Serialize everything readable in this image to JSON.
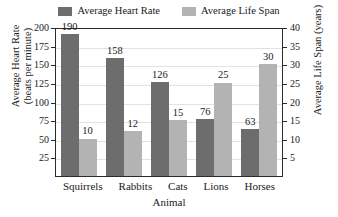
{
  "chart_data": {
    "type": "bar",
    "title": "",
    "categories": [
      "Squirrels",
      "Rabbits",
      "Cats",
      "Lions",
      "Horses"
    ],
    "series": [
      {
        "name": "Average Heart Rate",
        "values": [
          190,
          158,
          126,
          76,
          63
        ],
        "color": "#6d6d6d",
        "axis": "left"
      },
      {
        "name": "Average Life Span",
        "values": [
          10,
          12,
          15,
          25,
          30
        ],
        "color": "#b3b3b3",
        "axis": "right"
      }
    ],
    "xlabel": "Animal",
    "ylabel": "Average Heart Rate (beats per minute)",
    "ylabel_left_line1": "Average Heart Rate",
    "ylabel_left_line2": "(beats per minute)",
    "ylabel_right": "Average Life Span (years)",
    "ylim": [
      0,
      200
    ],
    "ylim_right": [
      0,
      40
    ],
    "yticks_left": [
      200,
      175,
      150,
      125,
      100,
      75,
      50,
      25
    ],
    "yticks_right": [
      40,
      35,
      30,
      25,
      20,
      15,
      10,
      5
    ],
    "grid": true,
    "legend_position": "top"
  },
  "legend": {
    "entries": [
      {
        "label": "Average Heart Rate",
        "color": "#6d6d6d"
      },
      {
        "label": "Average Life Span",
        "color": "#b3b3b3"
      }
    ]
  },
  "colors": {
    "heart_rate": "#6d6d6d",
    "life_span": "#b3b3b3",
    "axis": "#2b2b2b",
    "gridline": "#e2e2e2",
    "background": "#ffffff"
  }
}
